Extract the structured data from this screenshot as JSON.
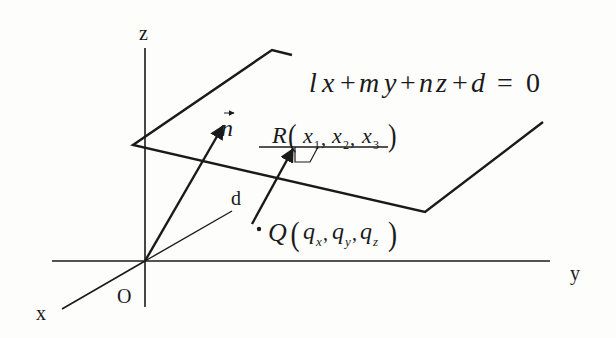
{
  "diagram": {
    "axes": {
      "x_label": "x",
      "y_label": "y",
      "z_label": "z",
      "origin_label": "O"
    },
    "plane_equation": {
      "l": "l",
      "x": "x",
      "plus1": "+",
      "m": "m",
      "y": "y",
      "plus2": "+",
      "n": "n",
      "z": "z",
      "plus3": "+",
      "d": "d",
      "equals": "=",
      "zero": "0",
      "full": "lx+my+nz+d=0"
    },
    "normal_vector_label": "n",
    "distance_label": "d",
    "point_R": {
      "name": "R",
      "coords": [
        "x",
        "x",
        "x"
      ],
      "subscripts": [
        "1",
        "2",
        "3"
      ],
      "full": "R(x1, x2, x3)"
    },
    "point_Q": {
      "name": "Q",
      "coords": [
        "q",
        "q",
        "q"
      ],
      "subscripts": [
        "x",
        "y",
        "z"
      ],
      "full": "Q(qx, qy, qz)"
    },
    "colors": {
      "line": "#1a1a1a",
      "background": "#fdfdfb"
    }
  }
}
